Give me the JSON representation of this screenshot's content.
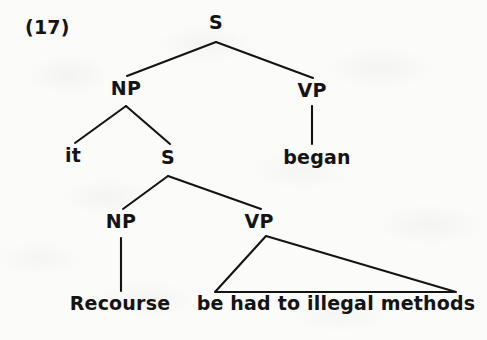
{
  "figure": {
    "example_number": "(17)",
    "type": "syntax-tree",
    "ink_color": "#141414",
    "paper_color": "#fbfbfa",
    "sentence": "it began Recourse be had to illegal methods"
  },
  "nodes": {
    "root_s": "S",
    "subject_np": "NP",
    "matrix_vp": "VP",
    "embedded_s": "S",
    "embedded_np": "NP",
    "embedded_vp": "VP"
  },
  "leaves": {
    "expletive": "it",
    "matrix_verb": "began",
    "embedded_subject": "Recourse",
    "embedded_predicate": "be had to illegal methods"
  },
  "geometry": {
    "root_s": {
      "x": 216,
      "y": 22
    },
    "subject_np": {
      "x": 126,
      "y": 88
    },
    "matrix_vp": {
      "x": 312,
      "y": 90
    },
    "expletive": {
      "x": 73,
      "y": 155
    },
    "embedded_s": {
      "x": 168,
      "y": 157
    },
    "matrix_verb": {
      "x": 317,
      "y": 157
    },
    "embedded_np": {
      "x": 121,
      "y": 221
    },
    "embedded_vp": {
      "x": 259,
      "y": 221
    },
    "embedded_subject": {
      "x": 120,
      "y": 303
    },
    "embedded_predicate": {
      "x": 336,
      "y": 303
    },
    "triangle": {
      "apex_x": 266,
      "apex_y": 236,
      "left_x": 215,
      "right_x": 456,
      "base_y": 292
    }
  }
}
